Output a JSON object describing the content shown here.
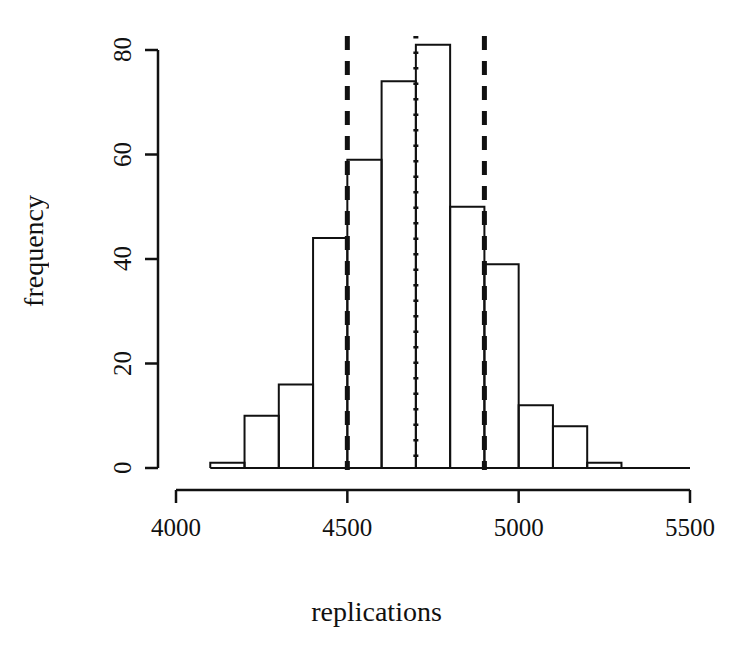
{
  "figure": {
    "width": 753,
    "height": 649,
    "background": "#ffffff",
    "foreground": "#111111"
  },
  "chart_data": {
    "type": "bar",
    "subtype": "histogram",
    "title": "",
    "subtitle": "",
    "xlabel": "replications",
    "ylabel": "frequency",
    "xlim": [
      4000,
      5500
    ],
    "ylim": [
      0,
      80
    ],
    "grid": false,
    "legend": null,
    "legend_position": "none",
    "bin_width": 100,
    "bin_edges": [
      4100,
      4200,
      4300,
      4400,
      4500,
      4600,
      4700,
      4800,
      4900,
      5000,
      5100,
      5200,
      5300,
      5400
    ],
    "bin_centers": [
      4150,
      4250,
      4350,
      4450,
      4550,
      4650,
      4750,
      4850,
      4950,
      5050,
      5150,
      5250,
      5350
    ],
    "values": [
      1,
      10,
      16,
      44,
      59,
      74,
      81,
      50,
      39,
      12,
      8,
      1,
      0
    ],
    "x_ticks": [
      4000,
      4500,
      5000,
      5500
    ],
    "x_tick_labels": [
      "4000",
      "4500",
      "5000",
      "5500"
    ],
    "y_ticks": [
      0,
      20,
      40,
      60,
      80
    ],
    "y_tick_labels": [
      "0",
      "20",
      "40",
      "60",
      "80"
    ],
    "bar_style": {
      "fill": "none",
      "stroke": "#111111",
      "stroke_width": 2
    },
    "annotations": [
      {
        "name": "lower-confidence-bound",
        "type": "vline",
        "x": 4500,
        "linestyle": "dashed",
        "color": "#111111",
        "linewidth": 5
      },
      {
        "name": "point-estimate",
        "type": "vline",
        "x": 4700,
        "linestyle": "dotted",
        "color": "#111111",
        "linewidth": 5
      },
      {
        "name": "upper-confidence-bound",
        "type": "vline",
        "x": 4900,
        "linestyle": "dashed",
        "color": "#111111",
        "linewidth": 5
      }
    ]
  }
}
